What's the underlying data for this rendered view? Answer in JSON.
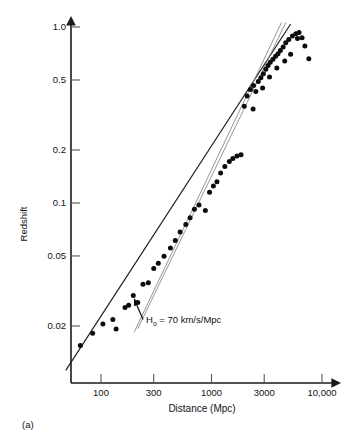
{
  "figure": {
    "panel_label": "(a)",
    "background_color": "#ffffff",
    "ink_color": "#111111"
  },
  "chart_data": {
    "type": "scatter",
    "title": "",
    "subtitle": "",
    "xlabel": "Distance (Mpc)",
    "ylabel": "Redshift",
    "xscale": "log",
    "yscale": "log",
    "xlim": [
      45,
      13000
    ],
    "ylim": [
      0.012,
      1.15
    ],
    "grid": false,
    "legend_position": "none",
    "xticks": [
      100,
      300,
      1000,
      3000,
      10000
    ],
    "xtick_labels": [
      "100",
      "300",
      "1000",
      "3000",
      "10,000"
    ],
    "yticks": [
      1.0,
      0.5,
      0.2,
      0.1,
      0.05,
      0.02
    ],
    "ytick_labels": [
      "1.0",
      "0.5",
      "0.2",
      "0.1",
      "0.05",
      "0.02"
    ],
    "annotations": [
      {
        "name": "hubble-constant-annotation",
        "text": "H",
        "subscript": "o",
        "text_rest": " = 70 km/s/Mpc",
        "full_text": "Ho = 70 km/s/Mpc",
        "x": 330,
        "y": 0.0215,
        "arrow_to_x": 200,
        "arrow_to_y": 0.027
      }
    ],
    "series": [
      {
        "name": "Hubble law fit (H0 = 70 km/s/Mpc)",
        "type": "line",
        "color": "#1a1a1a",
        "points": [
          [
            48,
            0.0112
          ],
          [
            5200,
            1.04
          ]
        ]
      },
      {
        "name": "Alternate model curve 1",
        "type": "line",
        "color": "#8a8a8a",
        "points": [
          [
            200,
            0.0185
          ],
          [
            4300,
            1.06
          ]
        ]
      },
      {
        "name": "Alternate model curve 2",
        "type": "line",
        "color": "#8a8a8a",
        "points": [
          [
            215,
            0.0193
          ],
          [
            4700,
            1.06
          ]
        ]
      },
      {
        "name": "Supernova redshift-distance observations",
        "type": "scatter",
        "color": "#0c0c0c",
        "x": [
          65,
          84,
          104,
          128,
          137,
          165,
          178,
          196,
          215,
          240,
          268,
          300,
          330,
          372,
          425,
          470,
          520,
          585,
          640,
          700,
          770,
          880,
          960,
          1040,
          1120,
          1210,
          1320,
          1450,
          1560,
          1700,
          1850,
          1980,
          2100,
          2250,
          2400,
          2520,
          2650,
          2800,
          2950,
          3100,
          3250,
          3400,
          3600,
          3800,
          4000,
          4200,
          4450,
          4700,
          5000,
          5400,
          5800,
          6200,
          6600,
          7000,
          7600,
          2380,
          2900,
          3350,
          3900,
          4600,
          5200,
          6000
        ],
        "y": [
          0.0155,
          0.0182,
          0.0205,
          0.0218,
          0.0192,
          0.0255,
          0.0262,
          0.0298,
          0.0272,
          0.0345,
          0.0352,
          0.0425,
          0.0455,
          0.0498,
          0.0555,
          0.0612,
          0.0685,
          0.0755,
          0.0825,
          0.092,
          0.0975,
          0.0905,
          0.115,
          0.125,
          0.132,
          0.148,
          0.161,
          0.172,
          0.179,
          0.185,
          0.188,
          0.355,
          0.405,
          0.442,
          0.465,
          0.43,
          0.49,
          0.515,
          0.542,
          0.575,
          0.605,
          0.63,
          0.655,
          0.682,
          0.705,
          0.735,
          0.77,
          0.815,
          0.85,
          0.89,
          0.915,
          0.93,
          0.87,
          0.78,
          0.66,
          0.342,
          0.45,
          0.52,
          0.585,
          0.64,
          0.7,
          0.86
        ]
      }
    ]
  }
}
